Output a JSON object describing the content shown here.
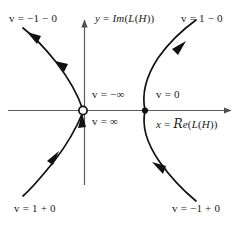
{
  "figure": {
    "type": "complex-plane-phase-diagram",
    "background": "#ffffff",
    "stroke_color": "#111111",
    "axis_color": "#5a5a5a",
    "width": 243,
    "height": 227
  },
  "axes": {
    "x_axis": {
      "label_prefix": "x",
      "label_equals": "=",
      "label_func_re": "Re",
      "label_arg": "(L(H))",
      "label_full": "x = Re(L(H))"
    },
    "y_axis": {
      "label_prefix": "y",
      "label_equals": "=",
      "label_func_im": "Im",
      "label_arg": "(L(H))",
      "label_full": "y = Im(L(H))"
    }
  },
  "nodes": {
    "open_point": {
      "name": "open-circle-node",
      "style": "hollow",
      "x": 83,
      "y": 110
    },
    "filled_point": {
      "name": "filled-dot-node",
      "style": "solid",
      "x": 145,
      "y": 110
    }
  },
  "labels": {
    "top_left": "v = −1 − 0",
    "top_right": "v = 1 − 0",
    "bottom_left": "v = 1 + 0",
    "bottom_right": "v = −1 + 0",
    "center_upper": "v = −∞",
    "center_lower": "v = ∞",
    "right_of_origin": "v = 0"
  },
  "branches": [
    {
      "name": "upper-left-branch",
      "from": "open-circle-node",
      "direction": "up-left",
      "arrow_count": 2,
      "end_label": "v = −1 − 0"
    },
    {
      "name": "lower-left-branch",
      "from": "bottom-left",
      "direction": "up-right",
      "arrow_count": 2,
      "end_label": "v = 1 + 0"
    },
    {
      "name": "upper-right-branch",
      "from": "filled-dot-node",
      "direction": "up-right",
      "arrow_count": 1,
      "end_label": "v = 1 − 0"
    },
    {
      "name": "lower-right-branch",
      "from": "bottom-right",
      "direction": "up-left",
      "arrow_count": 1,
      "end_label": "v = −1 + 0"
    }
  ]
}
